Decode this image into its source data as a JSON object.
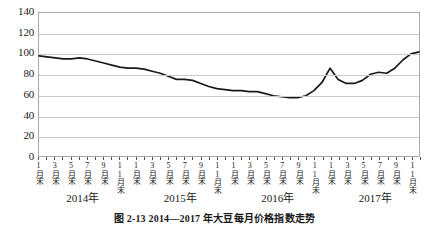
{
  "chart_data": {
    "type": "line",
    "title": "",
    "caption": "图 2-13  2014—2017 年大豆每月价格指数走势",
    "xlabel": "",
    "ylabel": "",
    "ylim": [
      0,
      140
    ],
    "y_ticks": [
      0,
      20,
      40,
      60,
      80,
      100,
      120,
      140
    ],
    "grid": true,
    "legend": false,
    "line_color": "#1a1a1a",
    "gridline_color": "#c9c9c9",
    "frame_color": "#aaaaaa",
    "x_tick_labels": [
      "1月末",
      "3月末",
      "5月末",
      "7月末",
      "9月末",
      "11月末",
      "1月末",
      "3月末",
      "5月末",
      "7月末",
      "9月末",
      "11月末",
      "1月末",
      "3月末",
      "5月末",
      "7月末",
      "9月末",
      "11月末",
      "1月末",
      "3月末",
      "5月末",
      "7月末",
      "9月末",
      "11月末"
    ],
    "year_groups": [
      {
        "label": "2014年",
        "center_index": 5.5
      },
      {
        "label": "2015年",
        "center_index": 17.5
      },
      {
        "label": "2016年",
        "center_index": 29.5
      },
      {
        "label": "2017年",
        "center_index": 41.5
      }
    ],
    "x": [
      "2014-01",
      "2014-02",
      "2014-03",
      "2014-04",
      "2014-05",
      "2014-06",
      "2014-07",
      "2014-08",
      "2014-09",
      "2014-10",
      "2014-11",
      "2014-12",
      "2015-01",
      "2015-02",
      "2015-03",
      "2015-04",
      "2015-05",
      "2015-06",
      "2015-07",
      "2015-08",
      "2015-09",
      "2015-10",
      "2015-11",
      "2015-12",
      "2016-01",
      "2016-02",
      "2016-03",
      "2016-04",
      "2016-05",
      "2016-06",
      "2016-07",
      "2016-08",
      "2016-09",
      "2016-10",
      "2016-11",
      "2016-12",
      "2017-01",
      "2017-02",
      "2017-03",
      "2017-04",
      "2017-05",
      "2017-06",
      "2017-07",
      "2017-08",
      "2017-09",
      "2017-10",
      "2017-11",
      "2017-12"
    ],
    "values": [
      98,
      97,
      96,
      95,
      95,
      96,
      95,
      93,
      91,
      89,
      87,
      86,
      86,
      85,
      83,
      81,
      78,
      75,
      75,
      74,
      71,
      68,
      66,
      65,
      64,
      64,
      63,
      63,
      61,
      59,
      58,
      57,
      57,
      59,
      64,
      72,
      86,
      75,
      71,
      71,
      74,
      80,
      82,
      81,
      86,
      94,
      100,
      102
    ],
    "series_name": "价格指数"
  }
}
